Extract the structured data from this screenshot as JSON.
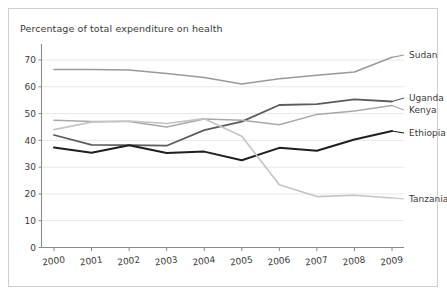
{
  "chart_data": {
    "type": "line",
    "title": "Percentage of total expenditure on health",
    "xlabel": "",
    "ylabel": "",
    "grid": true,
    "legend_position": "right-inline-labels",
    "categories": [
      "2000",
      "2001",
      "2002",
      "2003",
      "2004",
      "2005",
      "2006",
      "2007",
      "2008",
      "2009"
    ],
    "x": [
      2000,
      2001,
      2002,
      2003,
      2004,
      2005,
      2006,
      2007,
      2008,
      2009
    ],
    "xlim": [
      2000,
      2009
    ],
    "ylim": [
      0,
      75
    ],
    "yticks": [
      0,
      10,
      20,
      30,
      40,
      50,
      60,
      70
    ],
    "ytick_labels": [
      "0",
      "10",
      "20",
      "30",
      "40",
      "50",
      "60",
      "70"
    ],
    "series": [
      {
        "name": "Sudan",
        "color": "#9a9a9a",
        "width": 1.5,
        "values": [
          66.5,
          66.5,
          66.3,
          65.0,
          63.5,
          61.0,
          63.0,
          64.3,
          65.5,
          71.0
        ]
      },
      {
        "name": "Uganda",
        "color": "#5c5c5c",
        "width": 1.8,
        "values": [
          42.0,
          38.3,
          38.2,
          38.0,
          43.8,
          47.0,
          53.2,
          53.5,
          55.3,
          54.5
        ]
      },
      {
        "name": "Kenya",
        "color": "#a8a8a8",
        "width": 1.5,
        "values": [
          47.5,
          47.0,
          47.0,
          45.0,
          48.0,
          47.5,
          45.8,
          49.7,
          51.0,
          53.0
        ]
      },
      {
        "name": "Ethiopia",
        "color": "#1f1f1f",
        "width": 2.0,
        "values": [
          37.3,
          35.4,
          38.2,
          35.3,
          35.8,
          32.6,
          37.2,
          36.1,
          40.3,
          43.5
        ]
      },
      {
        "name": "Tanzania",
        "color": "#c4c4c4",
        "width": 1.6,
        "values": [
          44.0,
          46.8,
          47.2,
          46.3,
          48.1,
          41.5,
          23.4,
          19.0,
          19.5,
          18.5
        ]
      }
    ]
  },
  "labels": {
    "sudan": "Sudan",
    "uganda": "Uganda",
    "kenya": "Kenya",
    "ethiopia": "Ethiopia",
    "tanzania": "Tanzania"
  }
}
